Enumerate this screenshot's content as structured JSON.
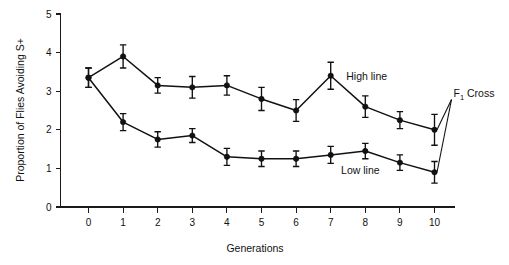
{
  "figure": {
    "background_color": "#ffffff",
    "ink_color": "#111111"
  },
  "chart_data": {
    "type": "line",
    "title": "",
    "xlabel": "Generations",
    "ylabel": "Proportion of Flies Avoiding S+",
    "x": [
      0,
      1,
      2,
      3,
      4,
      5,
      6,
      7,
      8,
      9,
      10
    ],
    "xlim": [
      -0.6,
      11.2
    ],
    "ylim": [
      0,
      5
    ],
    "xticks": [
      "0",
      "1",
      "2",
      "3",
      "4",
      "5",
      "6",
      "7",
      "8",
      "9",
      "10"
    ],
    "yticks": [
      "0",
      "1",
      "2",
      "3",
      "4",
      "5"
    ],
    "grid": false,
    "legend_position": "inline-annotations",
    "error_bars": "symmetric",
    "series": [
      {
        "name": "High line",
        "label": "High line",
        "marker": "filled-circle",
        "color": "#111111",
        "values": [
          3.35,
          3.9,
          3.15,
          3.1,
          3.15,
          2.8,
          2.5,
          3.4,
          2.6,
          2.25,
          2.0
        ],
        "errors": [
          0.25,
          0.3,
          0.2,
          0.28,
          0.25,
          0.3,
          0.28,
          0.35,
          0.28,
          0.22,
          0.4
        ]
      },
      {
        "name": "Low line",
        "label": "Low line",
        "marker": "filled-circle",
        "color": "#111111",
        "values": [
          3.35,
          2.2,
          1.75,
          1.85,
          1.3,
          1.25,
          1.25,
          1.35,
          1.45,
          1.15,
          0.9
        ],
        "errors": [
          0.25,
          0.22,
          0.2,
          0.18,
          0.22,
          0.2,
          0.2,
          0.22,
          0.2,
          0.2,
          0.28
        ]
      }
    ],
    "annotations": [
      {
        "id": "high-line-label",
        "text": "High line",
        "x": 7.45,
        "y": 3.38
      },
      {
        "id": "low-line-label",
        "text": "Low line",
        "x": 7.3,
        "y": 0.95
      },
      {
        "id": "f1-cross-label",
        "text_prefix": "F",
        "text_subscript": "1",
        "text_suffix": " Cross",
        "full_text": "F1 Cross",
        "x": 10.55,
        "y": 2.85,
        "points_to": [
          {
            "x": 10,
            "y": 2.0
          },
          {
            "x": 10,
            "y": 0.9
          }
        ]
      }
    ]
  }
}
